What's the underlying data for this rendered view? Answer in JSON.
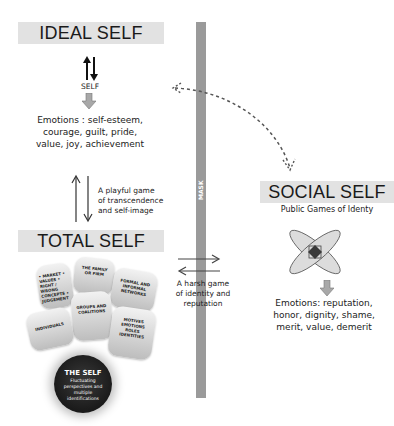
{
  "ideal_self": {
    "title": "IDEAL SELF",
    "self_label": "SELF",
    "emotions": [
      "Emotions : self-esteem,",
      "courage, guilt, pride,",
      "value, joy, achievement"
    ]
  },
  "playful_game": {
    "lines": [
      "A playful game",
      "of transcendence",
      "and self-image"
    ]
  },
  "total_self": {
    "title": "TOTAL SELF",
    "segments": [
      {
        "label": "• MARKET • VALUES • RIGHT / WRONG CONCEPTS • JUDGEMENT"
      },
      {
        "label": "THE FAMILY OR FIRM"
      },
      {
        "label": "FORMAL AND INFORMAL NETWORKS"
      },
      {
        "label": "GROUPS AND COALITIONS"
      },
      {
        "label": "INDIVIDUALS"
      },
      {
        "label": "MOTIVES EMOTIONS ROLES IDENTITIES"
      }
    ],
    "core": {
      "title": "THE SELF",
      "subtitle": "Fluctuating perspectives and multiple identifications"
    }
  },
  "mask": {
    "label": "MASK",
    "color": "#9a9a9a"
  },
  "harsh_game": {
    "lines": [
      "A harsh game",
      "of identity and",
      "reputation"
    ]
  },
  "social_self": {
    "title": "SOCIAL SELF",
    "subtitle": "Public Games of Identy",
    "emotions": [
      "Emotions: reputation,",
      "honor, dignity, shame,",
      "merit, value, demerit"
    ]
  },
  "colors": {
    "title_box": "#e2e2e2",
    "arrow": "#333333",
    "block_arrow": "#9a9a9a",
    "petal": "#dcdcdc",
    "core": "#1f1f1f"
  }
}
